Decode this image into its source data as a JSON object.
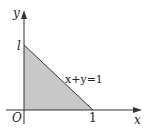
{
  "figure": {
    "axes": {
      "x_label": "x",
      "y_label": "y",
      "origin_label": "O"
    },
    "ticks": {
      "x_intercept_label": "1",
      "y_intercept_label": "l"
    },
    "line_label": "x+y=1",
    "colors": {
      "axis": "#333333",
      "shaded_region": "#c8c8c8",
      "line": "#333333",
      "text": "#222222"
    },
    "region": {
      "description": "shaded triangle bounded by x=0, y=0, x+y=1",
      "vertices": [
        [
          0,
          0
        ],
        [
          1,
          0
        ],
        [
          0,
          1
        ]
      ]
    }
  }
}
